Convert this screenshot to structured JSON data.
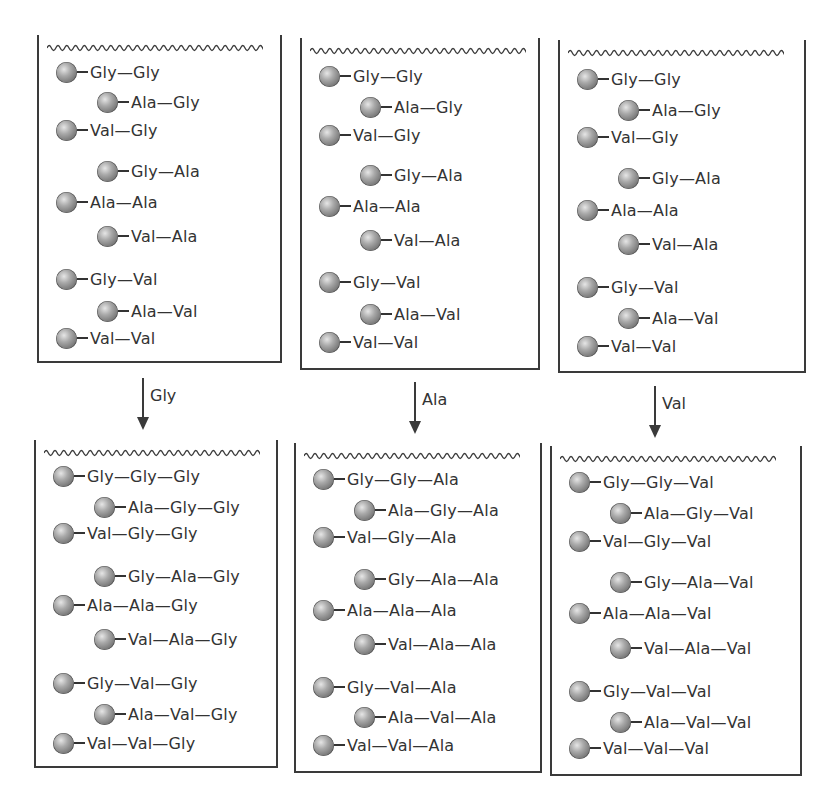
{
  "figure": {
    "top_row": [
      {
        "id": "vessel-1-before",
        "peptides": [
          "Gly—Gly",
          "Ala—Gly",
          "Val—Gly",
          "Gly—Ala",
          "Ala—Ala",
          "Val—Ala",
          "Gly—Val",
          "Ala—Val",
          "Val—Val"
        ]
      },
      {
        "id": "vessel-2-before",
        "peptides": [
          "Gly—Gly",
          "Ala—Gly",
          "Val—Gly",
          "Gly—Ala",
          "Ala—Ala",
          "Val—Ala",
          "Gly—Val",
          "Ala—Val",
          "Val—Val"
        ]
      },
      {
        "id": "vessel-3-before",
        "peptides": [
          "Gly—Gly",
          "Ala—Gly",
          "Val—Gly",
          "Gly—Ala",
          "Ala—Ala",
          "Val—Ala",
          "Gly—Val",
          "Ala—Val",
          "Val—Val"
        ]
      }
    ],
    "arrows": [
      {
        "label": "Gly"
      },
      {
        "label": "Ala"
      },
      {
        "label": "Val"
      }
    ],
    "bottom_row": [
      {
        "id": "vessel-1-after",
        "peptides": [
          "Gly—Gly—Gly",
          "Ala—Gly—Gly",
          "Val—Gly—Gly",
          "Gly—Ala—Gly",
          "Ala—Ala—Gly",
          "Val—Ala—Gly",
          "Gly—Val—Gly",
          "Ala—Val—Gly",
          "Val—Val—Gly"
        ]
      },
      {
        "id": "vessel-2-after",
        "peptides": [
          "Gly—Gly—Ala",
          "Ala—Gly—Ala",
          "Val—Gly—Ala",
          "Gly—Ala—Ala",
          "Ala—Ala—Ala",
          "Val—Ala—Ala",
          "Gly—Val—Ala",
          "Ala—Val—Ala",
          "Val—Val—Ala"
        ]
      },
      {
        "id": "vessel-3-after",
        "peptides": [
          "Gly—Gly—Val",
          "Ala—Gly—Val",
          "Val—Gly—Val",
          "Gly—Ala—Val",
          "Ala—Ala—Val",
          "Val—Ala—Val",
          "Gly—Val—Val",
          "Ala—Val—Val",
          "Val—Val—Val"
        ]
      }
    ],
    "colors": {
      "line": "#3a3a3a",
      "text": "#333333",
      "bead": "#8a8a8a"
    }
  }
}
